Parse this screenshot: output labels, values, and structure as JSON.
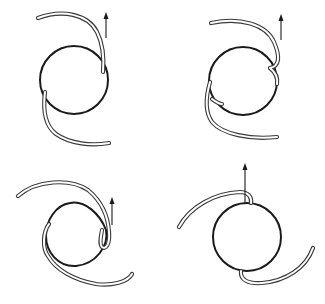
{
  "figure": {
    "description": "Four intraocular lens designs with looped haptics; arrows indicate direction",
    "colors": {
      "background": "#ffffff",
      "optic_stroke": "#1a1a1a",
      "haptic_stroke": "#3a3a3a"
    },
    "panels": [
      {
        "id": "top-left",
        "optic": {
          "shape": "circle",
          "cx": 74,
          "cy": 80,
          "r": 34
        },
        "arrow": {
          "x": 106,
          "y_from": 37,
          "y_to": 12
        }
      },
      {
        "id": "top-right",
        "optic": {
          "shape": "circle",
          "cx": 243,
          "cy": 81,
          "r": 34
        },
        "arrow": {
          "x": 281,
          "y_from": 40,
          "y_to": 14
        }
      },
      {
        "id": "bottom-left",
        "optic": {
          "shape": "irregular-loop",
          "cx": 74,
          "cy": 227
        },
        "arrow": {
          "x": 112,
          "y_from": 225,
          "y_to": 197
        }
      },
      {
        "id": "bottom-right",
        "optic": {
          "shape": "circle",
          "cx": 247,
          "cy": 237,
          "r": 34
        },
        "arrow": {
          "x": 245,
          "y_from": 204,
          "y_to": 163
        }
      }
    ]
  }
}
